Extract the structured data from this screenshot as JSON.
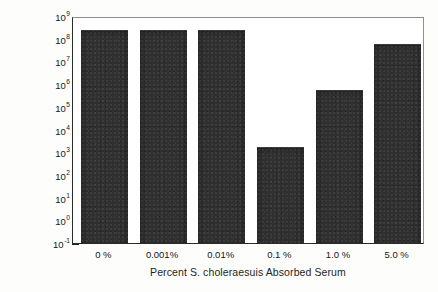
{
  "chart_data": {
    "type": "bar",
    "title": "",
    "xlabel": "Percent S. choleraesuis Absorbed Serum",
    "ylabel": "Bacteria/ml",
    "yscale": "log",
    "ylim": [
      0.1,
      1000000000
    ],
    "grid": false,
    "legend": null,
    "categories": [
      "0 %",
      "0.001%",
      "0.01%",
      "0.1 %",
      "1.0 %",
      "5.0 %"
    ],
    "values": [
      300000000,
      300000000,
      300000000,
      2000,
      700000,
      70000000
    ],
    "y_tick_labels": [
      {
        "mantissa": "10",
        "exponent": "9",
        "value": 1000000000
      },
      {
        "mantissa": "10",
        "exponent": "8",
        "value": 100000000
      },
      {
        "mantissa": "10",
        "exponent": "7",
        "value": 10000000
      },
      {
        "mantissa": "10",
        "exponent": "6",
        "value": 1000000
      },
      {
        "mantissa": "10",
        "exponent": "5",
        "value": 100000
      },
      {
        "mantissa": "10",
        "exponent": "4",
        "value": 10000
      },
      {
        "mantissa": "10",
        "exponent": "3",
        "value": 1000
      },
      {
        "mantissa": "10",
        "exponent": "2",
        "value": 100
      },
      {
        "mantissa": "10",
        "exponent": "1",
        "value": 10
      },
      {
        "mantissa": "10",
        "exponent": "0",
        "value": 1
      },
      {
        "mantissa": "10",
        "exponent": "-1",
        "value": 0.1
      }
    ],
    "bar_color": "#2f2f2f",
    "axis_color": "#2a2a2a",
    "frame_color": "#8f8f8f",
    "background_color": "#ffffff"
  }
}
